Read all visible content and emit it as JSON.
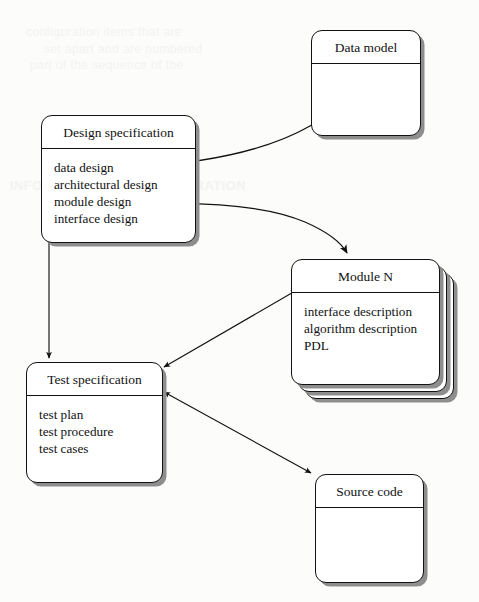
{
  "diagram": {
    "type": "flow-diagram",
    "background_color": "#fcfcfb",
    "line_color": "#121212",
    "shadow_color": "#8e8e8e"
  },
  "ghost_text": [
    "configuration items that are",
    "set apart and are numbered",
    "part of the sequence of the",
    "INFORMATION OF CONFIGURATION"
  ],
  "nodes": [
    {
      "id": "data-model",
      "title": "Data model",
      "items": [],
      "stacked": false,
      "x": 311,
      "y": 30,
      "w": 110,
      "h": 106,
      "header_h": 39
    },
    {
      "id": "design-specification",
      "title": "Design specification",
      "items": [
        "data design",
        "architectural design",
        "module design",
        "interface design"
      ],
      "stacked": false,
      "x": 41,
      "y": 115,
      "w": 155,
      "h": 128,
      "header_h": 37
    },
    {
      "id": "module-n",
      "title": "Module N",
      "items": [
        "interface description",
        "algorithm description",
        "PDL"
      ],
      "stacked": true,
      "stack_count": 2,
      "stack_offset": 7,
      "x": 291,
      "y": 259,
      "w": 149,
      "h": 126,
      "header_h": 39
    },
    {
      "id": "test-specification",
      "title": "Test specification",
      "items": [
        "test plan",
        "test procedure",
        "test cases"
      ],
      "stacked": false,
      "x": 26,
      "y": 362,
      "w": 137,
      "h": 121,
      "header_h": 39
    },
    {
      "id": "source-code",
      "title": "Source code",
      "items": [],
      "stacked": false,
      "x": 315,
      "y": 474,
      "w": 109,
      "h": 109,
      "header_h": 41
    }
  ],
  "edges": [
    {
      "id": "data-design-to-data-model",
      "from": "design-specification.data design",
      "to": "data-model",
      "style": "curved",
      "arrowheads": "end"
    },
    {
      "id": "module-design-to-module-n",
      "from": "design-specification.module design",
      "to": "module-n",
      "style": "curved",
      "arrowheads": "end"
    },
    {
      "id": "design-spec-to-test-spec",
      "from": "design-specification",
      "to": "test-specification",
      "style": "straight-vertical",
      "arrowheads": "both"
    },
    {
      "id": "test-spec-to-module-n",
      "from": "test-specification",
      "to": "module-n",
      "style": "straight-diagonal",
      "arrowheads": "both"
    },
    {
      "id": "test-spec-to-source-code",
      "from": "test-specification",
      "to": "source-code",
      "style": "straight-diagonal",
      "arrowheads": "both"
    }
  ]
}
